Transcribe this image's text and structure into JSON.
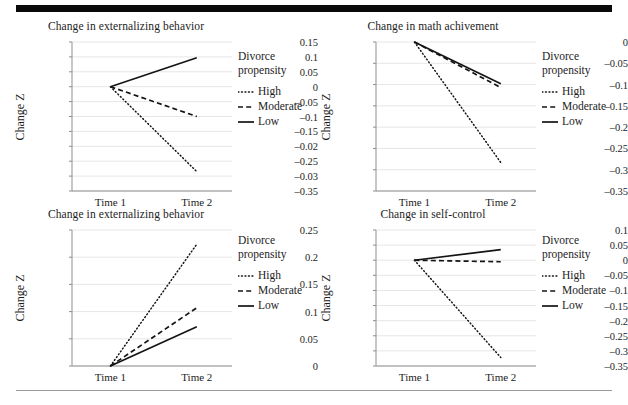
{
  "figure": {
    "legend_title_line1": "Divorce",
    "legend_title_line2": "propensity",
    "legend_entries": [
      {
        "label": "High",
        "style": "dotted"
      },
      {
        "label": "Moderate",
        "style": "dashed"
      },
      {
        "label": "Low",
        "style": "solid"
      }
    ],
    "x_categories": [
      "Time 1",
      "Time 2"
    ],
    "y_axis_label": "Change Z",
    "line_color": "#141414",
    "gridline_color": "#e6e6e6",
    "axis_color": "#8f8f8f",
    "rule_color": "#0a0a0a"
  },
  "chart_data": [
    {
      "type": "line",
      "panel": "top-left",
      "title": "Change in externalizing behavior",
      "xlabel": "",
      "ylabel": "Change Z",
      "x": [
        "Time 1",
        "Time 2"
      ],
      "ylim": [
        -0.35,
        0.15
      ],
      "yticks": [
        0.15,
        0.1,
        0.05,
        0,
        -0.05,
        -0.1,
        -0.15,
        -0.2,
        -0.25,
        -0.3,
        -0.35
      ],
      "ytick_labels": [
        "0.15",
        "0.1",
        "0.05",
        "0",
        "–0.05",
        "–0.1",
        "–0.15",
        "–0.02",
        "–0.25",
        "–0.03",
        "–0.35"
      ],
      "grid": true,
      "legend_position": "right",
      "series": [
        {
          "name": "High",
          "style": "dotted",
          "values": [
            0,
            -0.285
          ]
        },
        {
          "name": "Moderate",
          "style": "dashed",
          "values": [
            0,
            -0.1
          ]
        },
        {
          "name": "Low",
          "style": "solid",
          "values": [
            0,
            0.097
          ]
        }
      ]
    },
    {
      "type": "line",
      "panel": "top-right",
      "title": "Change in math achivement",
      "xlabel": "",
      "ylabel": "Change Z",
      "x": [
        "Time 1",
        "Time 2"
      ],
      "ylim": [
        -0.35,
        0
      ],
      "yticks": [
        0,
        -0.05,
        -0.1,
        -0.15,
        -0.2,
        -0.25,
        -0.3,
        -0.35
      ],
      "ytick_labels": [
        "0",
        "–0.05",
        "–0.1",
        "–0.15",
        "–0.2",
        "–0.25",
        "–0.3",
        "–0.35"
      ],
      "grid": true,
      "legend_position": "right",
      "series": [
        {
          "name": "High",
          "style": "dotted",
          "values": [
            0,
            -0.283
          ]
        },
        {
          "name": "Moderate",
          "style": "dashed",
          "values": [
            0,
            -0.107
          ]
        },
        {
          "name": "Low",
          "style": "solid",
          "values": [
            0,
            -0.098
          ]
        }
      ]
    },
    {
      "type": "line",
      "panel": "bottom-left",
      "title": "Change in externalizing behavior",
      "xlabel": "",
      "ylabel": "Change Z",
      "x": [
        "Time 1",
        "Time 2"
      ],
      "ylim": [
        0,
        0.25
      ],
      "yticks": [
        0.25,
        0.2,
        0.15,
        0.1,
        0.05,
        0
      ],
      "ytick_labels": [
        "0.25",
        "0.2",
        "0.15",
        "0.1",
        "0.05",
        "0"
      ],
      "grid": true,
      "legend_position": "right",
      "series": [
        {
          "name": "High",
          "style": "dotted",
          "values": [
            0,
            0.224
          ]
        },
        {
          "name": "Moderate",
          "style": "dashed",
          "values": [
            0,
            0.107
          ]
        },
        {
          "name": "Low",
          "style": "solid",
          "values": [
            0,
            0.072
          ]
        }
      ]
    },
    {
      "type": "line",
      "panel": "bottom-right",
      "title": "Change in self-control",
      "xlabel": "",
      "ylabel": "Change Z",
      "x": [
        "Time 1",
        "Time 2"
      ],
      "ylim": [
        -0.35,
        0.1
      ],
      "yticks": [
        0.1,
        0.05,
        0,
        -0.05,
        -0.1,
        -0.15,
        -0.2,
        -0.25,
        -0.3,
        -0.35
      ],
      "ytick_labels": [
        "0.1",
        "0.05",
        "0",
        "–0.05",
        "–0.1",
        "–0.15",
        "–0.2",
        "–0.25",
        "–0.3",
        "–0.35"
      ],
      "grid": true,
      "legend_position": "right",
      "series": [
        {
          "name": "High",
          "style": "dotted",
          "values": [
            0,
            -0.322
          ]
        },
        {
          "name": "Moderate",
          "style": "dashed",
          "values": [
            0,
            -0.005
          ]
        },
        {
          "name": "Low",
          "style": "solid",
          "values": [
            0,
            0.035
          ]
        }
      ]
    }
  ]
}
